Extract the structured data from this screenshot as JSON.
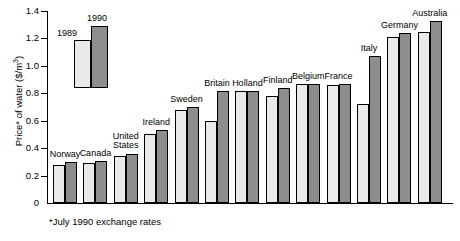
{
  "chart_data": {
    "type": "bar",
    "title": "",
    "subtitle": "",
    "xlabel": "",
    "ylabel": "Price* of water ($/m3)",
    "ylabel_display": "Price* of water ($/m",
    "ylabel_sup": "3",
    "ylabel_tail": ")",
    "ylim": [
      0,
      1.4
    ],
    "ytick_values": [
      0,
      0.2,
      0.4,
      0.6,
      0.8,
      1.0,
      1.2,
      1.4
    ],
    "ytick_labels": [
      "0",
      "0.2",
      "0.4",
      "0.6",
      "0.8",
      "1.0",
      "1.2",
      "1.4"
    ],
    "grid": false,
    "legend_position": "inset-top-left",
    "categories": [
      "Norway",
      "Canada",
      "United States",
      "Ireland",
      "Sweden",
      "Britain",
      "Holland",
      "Finland",
      "Belgium",
      "France",
      "Italy",
      "Germany",
      "Australia"
    ],
    "series": [
      {
        "name": "1989",
        "color": "#e9e9e9",
        "values": [
          0.28,
          0.29,
          0.34,
          0.5,
          0.68,
          0.6,
          0.82,
          0.78,
          0.87,
          0.86,
          0.72,
          1.21,
          1.25
        ]
      },
      {
        "name": "1990",
        "color": "#8d8d8d",
        "values": [
          0.3,
          0.31,
          0.36,
          0.53,
          0.7,
          0.82,
          0.82,
          0.84,
          0.87,
          0.87,
          1.07,
          1.24,
          1.33
        ]
      }
    ],
    "annotations": [
      "*July 1990 exchange rates"
    ]
  },
  "legend": {
    "item_1989": "1989",
    "item_1990": "1990"
  },
  "footnote": "*July 1990 exchange rates",
  "colors": {
    "series_1989": "#e9e9e9",
    "series_1990": "#8d8d8d",
    "axis": "#000000",
    "background": "#ffffff"
  }
}
